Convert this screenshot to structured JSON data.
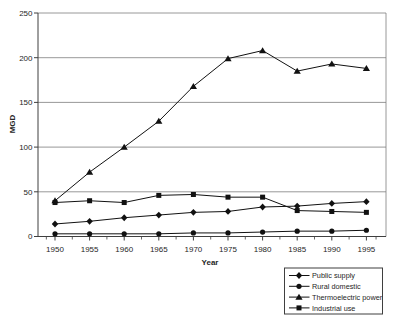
{
  "chart_data": {
    "type": "line",
    "title": "",
    "xlabel": "Year",
    "ylabel": "MGD",
    "x": [
      1950,
      1955,
      1960,
      1965,
      1970,
      1975,
      1980,
      1985,
      1990,
      1995
    ],
    "ylim": [
      0,
      250
    ],
    "yticks": [
      0,
      50,
      100,
      150,
      200,
      250
    ],
    "grid": true,
    "legend_position": "bottom-right-outside",
    "series": [
      {
        "name": "Public supply",
        "marker": "diamond",
        "color": "#111111",
        "values": [
          14,
          17,
          21,
          24,
          27,
          28,
          33,
          34,
          37,
          39
        ]
      },
      {
        "name": "Rural domestic",
        "marker": "circle",
        "color": "#111111",
        "values": [
          3,
          3,
          3,
          3,
          4,
          4,
          5,
          6,
          6,
          7
        ]
      },
      {
        "name": "Thermoelectric power",
        "marker": "triangle",
        "color": "#111111",
        "values": [
          40,
          72,
          100,
          129,
          168,
          199,
          208,
          185,
          193,
          188
        ]
      },
      {
        "name": "Industrial use",
        "marker": "square",
        "color": "#111111",
        "values": [
          38,
          40,
          38,
          46,
          47,
          44,
          44,
          29,
          28,
          27
        ]
      }
    ]
  },
  "colors": {
    "background": "#ffffff",
    "grid": "#7d7d7d",
    "axis": "#3f3f3f",
    "series": "#111111"
  }
}
